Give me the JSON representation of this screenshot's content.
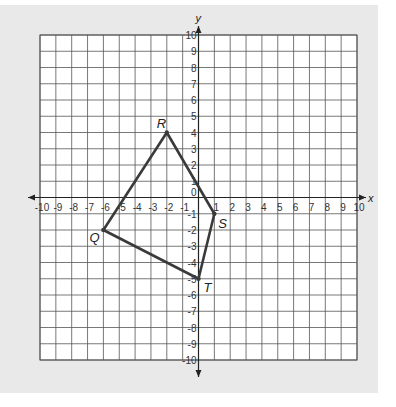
{
  "chart_data": {
    "type": "coordinate-grid",
    "title": "",
    "xlabel": "x",
    "ylabel": "y",
    "xlim": [
      -10,
      10
    ],
    "ylim": [
      -10,
      10
    ],
    "grid": true,
    "x_ticks": [
      -10,
      -9,
      -8,
      -7,
      -6,
      -5,
      -4,
      -3,
      -2,
      -1,
      1,
      2,
      3,
      4,
      5,
      6,
      7,
      8,
      9,
      10
    ],
    "y_ticks": [
      10,
      9,
      8,
      7,
      6,
      5,
      4,
      3,
      2,
      1,
      -1,
      -2,
      -3,
      -4,
      -5,
      -6,
      -7,
      -8,
      -9,
      -10
    ],
    "origin_label": "0",
    "polygon": {
      "name": "QRST",
      "vertices": [
        {
          "label": "R",
          "x": -2,
          "y": 4
        },
        {
          "label": "S",
          "x": 1,
          "y": -1
        },
        {
          "label": "T",
          "x": 0,
          "y": -5
        },
        {
          "label": "Q",
          "x": -6,
          "y": -2
        }
      ]
    }
  },
  "colors": {
    "panel": "#e9e9e9",
    "grid_fill": "#ffffff",
    "grid_line": "#555555",
    "polygon_stroke": "#3a3a3a"
  }
}
